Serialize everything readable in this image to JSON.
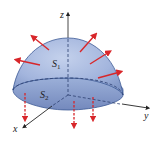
{
  "diagram": {
    "type": "3d-surface",
    "axes": {
      "x_label": "x",
      "y_label": "y",
      "z_label": "z"
    },
    "surfaces": {
      "top": {
        "label": "S",
        "subscript": "1"
      },
      "base": {
        "label": "S",
        "subscript": "2"
      }
    },
    "colors": {
      "surface_fill_light": "#b9c8e6",
      "surface_fill_dark": "#7f95c6",
      "surface_edge": "#3e5a96",
      "normal_arrow": "#d8262a",
      "axis": "#333333"
    },
    "normal_vectors": {
      "top_count": 6,
      "base_count": 4,
      "top_direction": "outward",
      "base_direction": "downward"
    }
  }
}
